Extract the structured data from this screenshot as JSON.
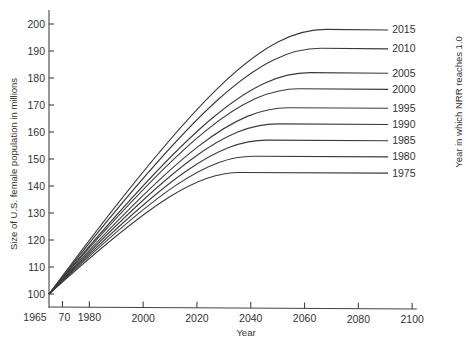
{
  "chart_data": {
    "type": "line",
    "title": "",
    "xlabel": "Year",
    "ylabel": "Size of U.S. female population in millions",
    "right_label": "Year in which NRR reaches 1.0",
    "xlim": [
      1965,
      2100
    ],
    "ylim": [
      100,
      200
    ],
    "x_ticks": [
      1965,
      1970,
      1980,
      2000,
      2020,
      2040,
      2060,
      2080,
      2100
    ],
    "x_tick_labels": [
      "1965",
      "70",
      "1980",
      "2000",
      "2020",
      "2040",
      "2060",
      "2080",
      "2100"
    ],
    "y_ticks": [
      100,
      110,
      120,
      130,
      140,
      150,
      160,
      170,
      180,
      190,
      200
    ],
    "y_tick_labels": [
      "100",
      "110",
      "120",
      "130",
      "140",
      "150",
      "160",
      "170",
      "180",
      "190",
      "200"
    ],
    "grid": false,
    "legend_position": "right-inline",
    "series": [
      {
        "name": "2015",
        "start": [
          1965,
          100
        ],
        "plateau_year": 2068,
        "plateau_value": 198
      },
      {
        "name": "2010",
        "start": [
          1965,
          100
        ],
        "plateau_year": 2066,
        "plateau_value": 191
      },
      {
        "name": "2005",
        "start": [
          1965,
          100
        ],
        "plateau_year": 2062,
        "plateau_value": 182
      },
      {
        "name": "2000",
        "start": [
          1965,
          100
        ],
        "plateau_year": 2058,
        "plateau_value": 176
      },
      {
        "name": "1995",
        "start": [
          1965,
          100
        ],
        "plateau_year": 2054,
        "plateau_value": 169
      },
      {
        "name": "1990",
        "start": [
          1965,
          100
        ],
        "plateau_year": 2050,
        "plateau_value": 163
      },
      {
        "name": "1985",
        "start": [
          1965,
          100
        ],
        "plateau_year": 2046,
        "plateau_value": 157
      },
      {
        "name": "1980",
        "start": [
          1965,
          100
        ],
        "plateau_year": 2041,
        "plateau_value": 151
      },
      {
        "name": "1975",
        "start": [
          1965,
          100
        ],
        "plateau_year": 2036,
        "plateau_value": 145
      }
    ]
  }
}
